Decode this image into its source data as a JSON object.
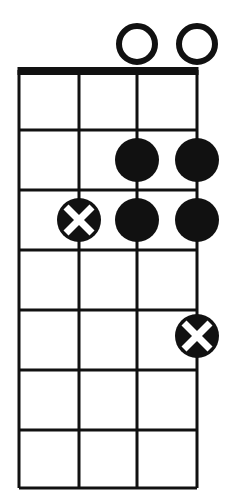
{
  "diagram": {
    "type": "chord-diagram",
    "instrument_strings": 4,
    "fret_count": 7,
    "orientation": "vertical",
    "nut_shown": true,
    "colors": {
      "ink": "#111111",
      "paper": "#ffffff",
      "marker_fill": "#111111",
      "marker_cross": "#ffffff",
      "open_marker_fill": "#ffffff"
    },
    "geometry": {
      "string_x": [
        19,
        79,
        137,
        197
      ],
      "fret_y": [
        70,
        130,
        190,
        250,
        310,
        370,
        430,
        488
      ],
      "nut_x1": 19,
      "nut_x2": 197,
      "nut_y": 71,
      "nut_thickness": 8,
      "grid_stroke": 3,
      "dot_radius": 22,
      "open_radius": 18,
      "open_stroke": 6,
      "open_center_y": 44,
      "cross_stroke": 7,
      "cross_arm": 13
    },
    "open_markers": [
      {
        "name": "open-string-3",
        "string_index": 2,
        "cx": 137,
        "cy": 44,
        "label": "O"
      },
      {
        "name": "open-string-4",
        "string_index": 3,
        "cx": 197,
        "cy": 44,
        "label": "O"
      }
    ],
    "finger_markers": [
      {
        "name": "dot-fret2-string3",
        "string_index": 2,
        "fret": 2,
        "cx": 137,
        "cy": 160,
        "style": "filled"
      },
      {
        "name": "dot-fret2-string4",
        "string_index": 3,
        "fret": 2,
        "cx": 197,
        "cy": 160,
        "style": "filled"
      },
      {
        "name": "dot-fret3-string2",
        "string_index": 1,
        "fret": 3,
        "cx": 79,
        "cy": 220,
        "style": "cross"
      },
      {
        "name": "dot-fret3-string3",
        "string_index": 2,
        "fret": 3,
        "cx": 137,
        "cy": 220,
        "style": "filled"
      },
      {
        "name": "dot-fret3-string4",
        "string_index": 3,
        "fret": 3,
        "cx": 197,
        "cy": 220,
        "style": "filled"
      },
      {
        "name": "dot-fret5-string4",
        "string_index": 3,
        "fret": 5,
        "cx": 197,
        "cy": 336,
        "style": "cross"
      }
    ]
  }
}
